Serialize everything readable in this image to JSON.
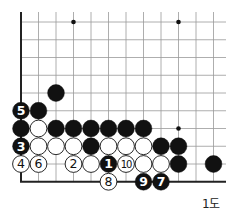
{
  "diagram": {
    "caption": "1도",
    "grid": {
      "x0": 21,
      "y0": 22,
      "dx": 17.5,
      "dy": 17.75,
      "cols": 12,
      "rows": 10,
      "left_edge": true,
      "bottom_edge": true
    },
    "star_points": [
      [
        3,
        0
      ],
      [
        9,
        0
      ],
      [
        9,
        6
      ]
    ],
    "stones": [
      {
        "col": 2,
        "row": 4,
        "color": "black",
        "label": ""
      },
      {
        "col": 0,
        "row": 5,
        "color": "black",
        "label": "5"
      },
      {
        "col": 1,
        "row": 5,
        "color": "black",
        "label": ""
      },
      {
        "col": 0,
        "row": 6,
        "color": "black",
        "label": ""
      },
      {
        "col": 1,
        "row": 6,
        "color": "white",
        "label": ""
      },
      {
        "col": 2,
        "row": 6,
        "color": "black",
        "label": ""
      },
      {
        "col": 3,
        "row": 6,
        "color": "black",
        "label": ""
      },
      {
        "col": 4,
        "row": 6,
        "color": "black",
        "label": ""
      },
      {
        "col": 5,
        "row": 6,
        "color": "black",
        "label": ""
      },
      {
        "col": 6,
        "row": 6,
        "color": "black",
        "label": ""
      },
      {
        "col": 7,
        "row": 6,
        "color": "black",
        "label": ""
      },
      {
        "col": 0,
        "row": 7,
        "color": "black",
        "label": "3"
      },
      {
        "col": 1,
        "row": 7,
        "color": "white",
        "label": ""
      },
      {
        "col": 2,
        "row": 7,
        "color": "white",
        "label": ""
      },
      {
        "col": 3,
        "row": 7,
        "color": "white",
        "label": ""
      },
      {
        "col": 4,
        "row": 7,
        "color": "black",
        "label": ""
      },
      {
        "col": 5,
        "row": 7,
        "color": "white",
        "label": ""
      },
      {
        "col": 6,
        "row": 7,
        "color": "white",
        "label": ""
      },
      {
        "col": 7,
        "row": 7,
        "color": "white",
        "label": ""
      },
      {
        "col": 8,
        "row": 7,
        "color": "black",
        "label": ""
      },
      {
        "col": 9,
        "row": 7,
        "color": "black",
        "label": ""
      },
      {
        "col": 0,
        "row": 8,
        "color": "white",
        "label": "4"
      },
      {
        "col": 1,
        "row": 8,
        "color": "white",
        "label": "6"
      },
      {
        "col": 3,
        "row": 8,
        "color": "white",
        "label": "2"
      },
      {
        "col": 4,
        "row": 8,
        "color": "white",
        "label": ""
      },
      {
        "col": 5,
        "row": 8,
        "color": "black",
        "label": "1"
      },
      {
        "col": 6,
        "row": 8,
        "color": "white",
        "label": "10"
      },
      {
        "col": 7,
        "row": 8,
        "color": "white",
        "label": ""
      },
      {
        "col": 8,
        "row": 8,
        "color": "white",
        "label": ""
      },
      {
        "col": 9,
        "row": 8,
        "color": "black",
        "label": ""
      },
      {
        "col": 11,
        "row": 8,
        "color": "black",
        "label": ""
      },
      {
        "col": 5,
        "row": 9,
        "color": "white",
        "label": "8"
      },
      {
        "col": 7,
        "row": 9,
        "color": "black",
        "label": "9"
      },
      {
        "col": 8,
        "row": 9,
        "color": "black",
        "label": "7"
      }
    ]
  }
}
